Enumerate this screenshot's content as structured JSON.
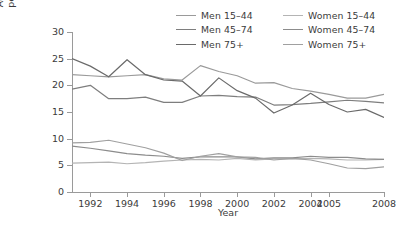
{
  "chart_data": {
    "type": "line",
    "title": "",
    "xlabel": "Year",
    "ylabel_line1": "Age-standardized rates",
    "ylabel_line2": "per 100 000 population",
    "ylim": [
      0,
      30
    ],
    "yticks": [
      0,
      5,
      10,
      15,
      20,
      25,
      30
    ],
    "xlim": [
      1991,
      2008
    ],
    "xticks": [
      1992,
      1994,
      1996,
      1998,
      2000,
      2002,
      2004,
      2005,
      2008
    ],
    "xtick_labels": [
      "1992",
      "1994",
      "1996",
      "1998",
      "2000",
      "2002",
      "2004",
      "2005",
      "2008"
    ],
    "grid": false,
    "legend_position": "top",
    "x": [
      1991,
      1992,
      1993,
      1994,
      1995,
      1996,
      1997,
      1998,
      1999,
      2000,
      2001,
      2002,
      2003,
      2004,
      2005,
      2006,
      2007,
      2008
    ],
    "series": [
      {
        "name": "Men 15–44",
        "color": "#9a9a9a",
        "values": [
          22.0,
          21.8,
          21.6,
          21.8,
          22.0,
          21.2,
          21.0,
          23.7,
          22.6,
          21.8,
          20.4,
          20.5,
          19.4,
          18.9,
          18.3,
          17.6,
          17.6,
          18.3
        ]
      },
      {
        "name": "Men 45–74",
        "color": "#7e7e7e",
        "values": [
          19.3,
          20.0,
          17.5,
          17.5,
          17.8,
          16.8,
          16.8,
          18.0,
          18.1,
          17.9,
          17.8,
          16.3,
          16.4,
          16.6,
          16.9,
          17.2,
          17.0,
          16.7
        ]
      },
      {
        "name": "Men 75+",
        "color": "#6a6a6a",
        "values": [
          25.0,
          23.6,
          21.6,
          24.8,
          22.0,
          21.0,
          20.8,
          18.0,
          21.4,
          19.0,
          17.6,
          14.8,
          16.3,
          18.5,
          16.4,
          15.0,
          15.5,
          14.0
        ]
      },
      {
        "name": "Women 15–44",
        "color": "#b4b4b4",
        "values": [
          5.4,
          5.5,
          5.6,
          5.3,
          5.5,
          5.8,
          6.0,
          6.1,
          6.0,
          6.3,
          6.0,
          6.2,
          6.2,
          6.3,
          6.2,
          6.0,
          6.0,
          6.1
        ]
      },
      {
        "name": "Women 45–74",
        "color": "#8c8c8c",
        "values": [
          8.6,
          8.2,
          7.7,
          7.2,
          6.9,
          6.7,
          6.3,
          6.6,
          6.6,
          6.6,
          6.2,
          6.4,
          6.4,
          6.7,
          6.5,
          6.5,
          6.2,
          6.1
        ]
      },
      {
        "name": "Women 75+",
        "color": "#a0a0a0",
        "values": [
          9.2,
          9.3,
          9.7,
          9.0,
          8.3,
          7.3,
          5.9,
          6.7,
          7.2,
          6.6,
          6.5,
          6.0,
          6.3,
          6.0,
          5.3,
          4.5,
          4.4,
          4.7
        ]
      }
    ]
  },
  "legend": {
    "entries": [
      {
        "label": "Men 15–44"
      },
      {
        "label": "Women 15–44"
      },
      {
        "label": "Men 45–74"
      },
      {
        "label": "Women 45–74"
      },
      {
        "label": "Men 75+"
      },
      {
        "label": "Women 75+"
      }
    ]
  },
  "caption": ""
}
